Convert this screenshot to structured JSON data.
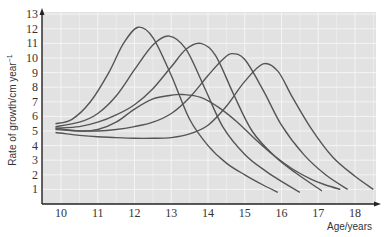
{
  "chart_data": {
    "type": "line",
    "title": "",
    "xlabel": "Age/years",
    "ylabel": "Rate of growth/cm year⁻¹",
    "xlim": [
      9.5,
      18.6
    ],
    "ylim": [
      0,
      13
    ],
    "x_ticks": [
      10,
      11,
      12,
      13,
      14,
      15,
      16,
      17,
      18
    ],
    "y_ticks": [
      1,
      2,
      3,
      4,
      5,
      6,
      7,
      8,
      9,
      10,
      11,
      12,
      13
    ],
    "grid": true,
    "legend": null,
    "series": [
      {
        "name": "curve-1",
        "points": [
          [
            9.85,
            5.5
          ],
          [
            10.3,
            5.8
          ],
          [
            10.8,
            7.0
          ],
          [
            11.3,
            9.0
          ],
          [
            11.7,
            11.0
          ],
          [
            12.1,
            12.1
          ],
          [
            12.5,
            11.4
          ],
          [
            13.0,
            8.8
          ],
          [
            13.5,
            5.8
          ],
          [
            14.0,
            4.0
          ],
          [
            14.5,
            2.8
          ],
          [
            15.0,
            2.0
          ],
          [
            15.5,
            1.3
          ],
          [
            15.9,
            0.8
          ]
        ]
      },
      {
        "name": "curve-2",
        "points": [
          [
            9.85,
            5.3
          ],
          [
            10.5,
            5.6
          ],
          [
            11.0,
            6.2
          ],
          [
            11.5,
            7.4
          ],
          [
            12.0,
            9.2
          ],
          [
            12.5,
            10.9
          ],
          [
            12.95,
            11.5
          ],
          [
            13.4,
            10.6
          ],
          [
            13.9,
            8.0
          ],
          [
            14.4,
            5.3
          ],
          [
            15.0,
            3.4
          ],
          [
            15.6,
            2.2
          ],
          [
            16.1,
            1.4
          ],
          [
            16.5,
            0.8
          ]
        ]
      },
      {
        "name": "curve-3",
        "points": [
          [
            9.85,
            5.2
          ],
          [
            10.5,
            5.3
          ],
          [
            11.0,
            5.6
          ],
          [
            11.5,
            6.1
          ],
          [
            12.0,
            6.8
          ],
          [
            12.5,
            7.9
          ],
          [
            13.0,
            9.4
          ],
          [
            13.4,
            10.6
          ],
          [
            13.8,
            11.0
          ],
          [
            14.2,
            10.2
          ],
          [
            14.7,
            7.5
          ],
          [
            15.2,
            5.0
          ],
          [
            15.8,
            3.3
          ],
          [
            16.4,
            2.1
          ],
          [
            17.1,
            0.9
          ]
        ]
      },
      {
        "name": "curve-4",
        "points": [
          [
            9.85,
            5.1
          ],
          [
            10.5,
            5.0
          ],
          [
            11.0,
            5.0
          ],
          [
            11.5,
            5.1
          ],
          [
            12.0,
            5.3
          ],
          [
            12.5,
            5.6
          ],
          [
            13.0,
            6.2
          ],
          [
            13.5,
            7.3
          ],
          [
            14.0,
            8.8
          ],
          [
            14.4,
            9.9
          ],
          [
            14.65,
            10.3
          ],
          [
            15.0,
            9.9
          ],
          [
            15.5,
            7.8
          ],
          [
            16.0,
            5.4
          ],
          [
            16.6,
            3.4
          ],
          [
            17.2,
            2.0
          ],
          [
            17.8,
            1.0
          ]
        ]
      },
      {
        "name": "curve-5",
        "points": [
          [
            9.85,
            4.9
          ],
          [
            10.5,
            4.7
          ],
          [
            11.0,
            4.6
          ],
          [
            11.5,
            4.55
          ],
          [
            12.0,
            4.5
          ],
          [
            12.5,
            4.5
          ],
          [
            13.0,
            4.55
          ],
          [
            13.5,
            4.8
          ],
          [
            14.0,
            5.4
          ],
          [
            14.5,
            6.7
          ],
          [
            15.0,
            8.4
          ],
          [
            15.5,
            9.6
          ],
          [
            15.9,
            9.1
          ],
          [
            16.3,
            7.3
          ],
          [
            16.8,
            5.2
          ],
          [
            17.4,
            3.2
          ],
          [
            18.0,
            1.9
          ],
          [
            18.5,
            1.0
          ]
        ]
      },
      {
        "name": "curve-6",
        "points": [
          [
            9.85,
            5.2
          ],
          [
            10.5,
            5.0
          ],
          [
            11.0,
            5.1
          ],
          [
            11.5,
            5.6
          ],
          [
            12.0,
            6.5
          ],
          [
            12.5,
            7.2
          ],
          [
            13.0,
            7.45
          ],
          [
            13.3,
            7.5
          ],
          [
            13.8,
            7.3
          ],
          [
            14.3,
            6.6
          ],
          [
            14.8,
            5.6
          ],
          [
            15.3,
            4.4
          ],
          [
            15.8,
            3.3
          ],
          [
            16.3,
            2.4
          ],
          [
            16.8,
            1.7
          ],
          [
            17.2,
            1.3
          ],
          [
            17.6,
            1.0
          ]
        ]
      }
    ]
  },
  "axis": {
    "x_label": "Age/years",
    "y_label": "Rate of growth/cm year",
    "y_label_sup": "−1"
  },
  "colors": {
    "plot_bg": "#e2e2e2",
    "grid": "#f4f4f4",
    "line": "#555555",
    "axis": "#222222"
  }
}
